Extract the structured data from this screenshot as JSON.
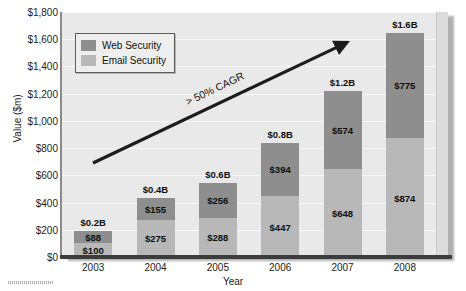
{
  "chart_data": {
    "type": "bar",
    "stacked": true,
    "title": "",
    "xlabel": "Year",
    "ylabel": "Value ($m)",
    "categories": [
      "2003",
      "2004",
      "2005",
      "2006",
      "2007",
      "2008"
    ],
    "ylim": [
      0,
      1800
    ],
    "ytick_values": [
      0,
      200,
      400,
      600,
      800,
      1000,
      1200,
      1400,
      1600,
      1800
    ],
    "ytick_labels": [
      "$0",
      "$200",
      "$400",
      "$600",
      "$800",
      "$1,000",
      "$1,200",
      "$1,400",
      "$1,600",
      "$1,800"
    ],
    "grid": true,
    "legend_position": "top-left",
    "series": [
      {
        "name": "Web Security",
        "color": "#8e8e8e",
        "values": [
          88,
          155,
          256,
          394,
          574,
          775
        ],
        "labels": [
          "$88",
          "$155",
          "$256",
          "$394",
          "$574",
          "$775"
        ]
      },
      {
        "name": "Email Security",
        "color": "#b8b8b8",
        "values": [
          100,
          275,
          288,
          447,
          648,
          874
        ],
        "labels": [
          "$100",
          "$275",
          "$288",
          "$447",
          "$648",
          "$874"
        ]
      }
    ],
    "totals": [
      188,
      430,
      544,
      841,
      1222,
      1649
    ],
    "total_labels": [
      "$0.2B",
      "$0.4B",
      "$0.6B",
      "$0.8B",
      "$1.2B",
      "$1.6B"
    ],
    "annotations": [
      {
        "text": "> 50% CAGR",
        "type": "arrow-label"
      }
    ],
    "arrow": {
      "x1": 93,
      "y1": 163,
      "x2": 348,
      "y2": 42,
      "color": "#1c1c1c"
    }
  },
  "legend": {
    "items": [
      {
        "label": "Web Security",
        "color": "#8e8e8e"
      },
      {
        "label": "Email Security",
        "color": "#b8b8b8"
      }
    ]
  },
  "axes": {
    "y_title": "Value ($m)",
    "x_title": "Year"
  },
  "colors": {
    "plot_background": "#e9e9e9",
    "web_security": "#8e8e8e",
    "email_security": "#b8b8b8",
    "axis": "#3c3c3c",
    "text": "#1c1c1c"
  }
}
